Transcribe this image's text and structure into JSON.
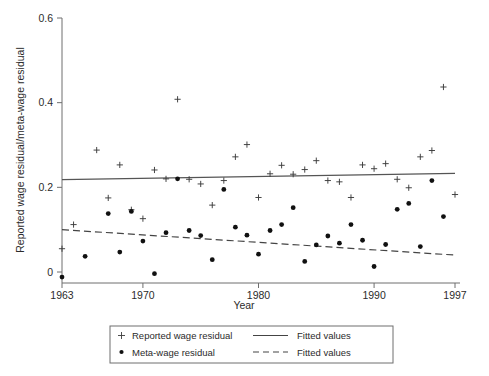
{
  "chart_data": {
    "type": "scatter",
    "title": "",
    "xlabel": "Year",
    "ylabel": "Reported wage residual/meta-wage residual",
    "xlim": [
      1963,
      1997
    ],
    "ylim": [
      0,
      0.6
    ],
    "xticks": [
      1963,
      1970,
      1980,
      1990,
      1997
    ],
    "xtick_labels": [
      "1963",
      "1970",
      "1980",
      "1990",
      "1997"
    ],
    "yticks": [
      0,
      0.2,
      0.4,
      0.6
    ],
    "ytick_labels": [
      "0",
      "0.2",
      "0.4",
      "0.6"
    ],
    "grid": false,
    "legend_position": "below-plot",
    "series": [
      {
        "name": "Reported wage residual",
        "marker": "plus",
        "color": "#3c3c3c",
        "points": [
          {
            "x": 1963,
            "y": 0.055
          },
          {
            "x": 1964,
            "y": 0.112
          },
          {
            "x": 1966,
            "y": 0.288
          },
          {
            "x": 1967,
            "y": 0.175
          },
          {
            "x": 1968,
            "y": 0.253
          },
          {
            "x": 1969,
            "y": 0.147
          },
          {
            "x": 1970,
            "y": 0.126
          },
          {
            "x": 1971,
            "y": 0.241
          },
          {
            "x": 1972,
            "y": 0.22
          },
          {
            "x": 1973,
            "y": 0.408
          },
          {
            "x": 1974,
            "y": 0.219
          },
          {
            "x": 1975,
            "y": 0.208
          },
          {
            "x": 1976,
            "y": 0.158
          },
          {
            "x": 1977,
            "y": 0.216
          },
          {
            "x": 1978,
            "y": 0.272
          },
          {
            "x": 1979,
            "y": 0.301
          },
          {
            "x": 1980,
            "y": 0.176
          },
          {
            "x": 1981,
            "y": 0.232
          },
          {
            "x": 1982,
            "y": 0.252
          },
          {
            "x": 1983,
            "y": 0.231
          },
          {
            "x": 1984,
            "y": 0.242
          },
          {
            "x": 1985,
            "y": 0.263
          },
          {
            "x": 1986,
            "y": 0.216
          },
          {
            "x": 1987,
            "y": 0.213
          },
          {
            "x": 1988,
            "y": 0.176
          },
          {
            "x": 1989,
            "y": 0.253
          },
          {
            "x": 1990,
            "y": 0.244
          },
          {
            "x": 1991,
            "y": 0.256
          },
          {
            "x": 1992,
            "y": 0.219
          },
          {
            "x": 1993,
            "y": 0.199
          },
          {
            "x": 1994,
            "y": 0.272
          },
          {
            "x": 1995,
            "y": 0.287
          },
          {
            "x": 1996,
            "y": 0.437
          },
          {
            "x": 1997,
            "y": 0.183
          }
        ]
      },
      {
        "name": "Meta-wage residual",
        "marker": "dot",
        "color": "#111111",
        "points": [
          {
            "x": 1963,
            "y": -0.012
          },
          {
            "x": 1965,
            "y": 0.037
          },
          {
            "x": 1967,
            "y": 0.138
          },
          {
            "x": 1968,
            "y": 0.047
          },
          {
            "x": 1969,
            "y": 0.143
          },
          {
            "x": 1970,
            "y": 0.073
          },
          {
            "x": 1971,
            "y": -0.004
          },
          {
            "x": 1972,
            "y": 0.093
          },
          {
            "x": 1973,
            "y": 0.22
          },
          {
            "x": 1974,
            "y": 0.098
          },
          {
            "x": 1975,
            "y": 0.086
          },
          {
            "x": 1976,
            "y": 0.029
          },
          {
            "x": 1977,
            "y": 0.195
          },
          {
            "x": 1978,
            "y": 0.106
          },
          {
            "x": 1979,
            "y": 0.087
          },
          {
            "x": 1980,
            "y": 0.042
          },
          {
            "x": 1981,
            "y": 0.098
          },
          {
            "x": 1982,
            "y": 0.112
          },
          {
            "x": 1983,
            "y": 0.152
          },
          {
            "x": 1984,
            "y": 0.025
          },
          {
            "x": 1985,
            "y": 0.064
          },
          {
            "x": 1986,
            "y": 0.085
          },
          {
            "x": 1987,
            "y": 0.068
          },
          {
            "x": 1988,
            "y": 0.112
          },
          {
            "x": 1989,
            "y": 0.075
          },
          {
            "x": 1990,
            "y": 0.013
          },
          {
            "x": 1991,
            "y": 0.065
          },
          {
            "x": 1992,
            "y": 0.148
          },
          {
            "x": 1993,
            "y": 0.162
          },
          {
            "x": 1994,
            "y": 0.06
          },
          {
            "x": 1995,
            "y": 0.216
          },
          {
            "x": 1996,
            "y": 0.131
          }
        ]
      }
    ],
    "fits": [
      {
        "name": "Fitted values",
        "for_series": "Reported wage residual",
        "style": "solid",
        "color": "#555555",
        "x0": 1963,
        "y0": 0.218,
        "x1": 1997,
        "y1": 0.233
      },
      {
        "name": "Fitted values",
        "for_series": "Meta-wage residual",
        "style": "dashed",
        "color": "#444444",
        "x0": 1963,
        "y0": 0.1,
        "x1": 1997,
        "y1": 0.04
      }
    ]
  },
  "legend": {
    "rows": [
      {
        "marker": "plus",
        "label": "Reported wage residual",
        "line_style": "solid",
        "line_label": "Fitted values"
      },
      {
        "marker": "dot",
        "label": "Meta-wage residual",
        "line_style": "dashed",
        "line_label": "Fitted values"
      }
    ]
  },
  "colors": {
    "axis": "#6e6e6e",
    "text": "#2b2b2b",
    "marker_plus": "#3c3c3c",
    "marker_dot": "#111111",
    "fit_solid": "#555555",
    "fit_dashed": "#444444",
    "legend_border": "#6e6e6e",
    "background": "#ffffff"
  }
}
